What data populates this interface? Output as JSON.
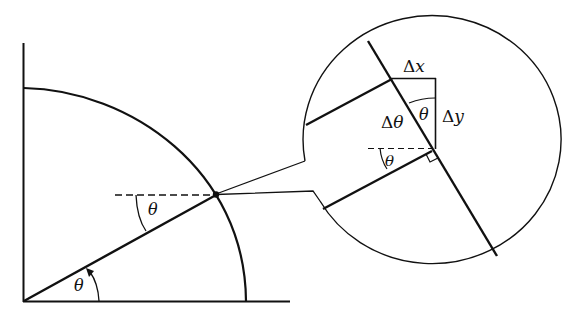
{
  "diagram": {
    "colors": {
      "ink": "#111111",
      "background": "#ffffff"
    },
    "main": {
      "origin_angle_label": "θ",
      "point_angle_label": "θ"
    },
    "inset": {
      "dx_delta": "Δ",
      "dx_var": "x",
      "dy_delta": "Δ",
      "dy_var": "y",
      "dtheta_delta": "Δ",
      "dtheta_var": "θ",
      "inner_angle_label": "θ",
      "lower_angle_label": "θ"
    }
  }
}
